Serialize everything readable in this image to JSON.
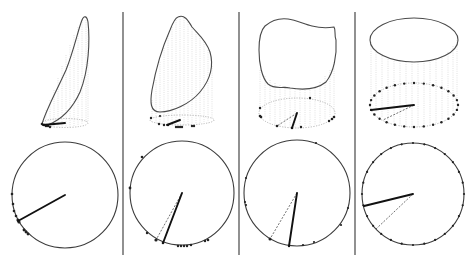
{
  "figure": {
    "colors": {
      "outline": "#4a4a4a",
      "guides": "#cfcfcf",
      "points": "#222222",
      "vector": "#111111"
    },
    "panels": [
      {
        "id": 1,
        "top": {
          "shape": "narrow tilted loop",
          "points_on_base": "clustered at left"
        },
        "bottom": {
          "circle_center": [
            65,
            195
          ],
          "radius": 53,
          "vector_end": [
            18,
            221
          ],
          "dashed_vector": false,
          "points": "clustered lower-left"
        }
      },
      {
        "id": 2,
        "top": {
          "shape": "tilted oval",
          "points_on_base": "spread along front"
        },
        "bottom": {
          "circle_center": [
            182,
            193
          ],
          "radius": 52,
          "vector_end": [
            163,
            243
          ],
          "dashed_vector": true,
          "dashed_end": [
            156,
            240
          ],
          "points": "mostly along bottom"
        }
      },
      {
        "id": 3,
        "top": {
          "shape": "irregular blob",
          "points_on_base": "spread around"
        },
        "bottom": {
          "circle_center": [
            297,
            193
          ],
          "radius": 53,
          "vector_end": [
            289,
            246
          ],
          "dashed_vector": true,
          "dashed_end": [
            270,
            239
          ],
          "points": "spread around circle"
        }
      },
      {
        "id": 4,
        "top": {
          "shape": "near-perfect circle",
          "points_on_base": "uniform around ellipse"
        },
        "bottom": {
          "circle_center": [
            413,
            194
          ],
          "radius": 51,
          "vector_end": [
            364,
            206
          ],
          "dashed_vector": true,
          "dashed_end": [
            376,
            229
          ],
          "points": "uniform around circle"
        }
      }
    ]
  }
}
